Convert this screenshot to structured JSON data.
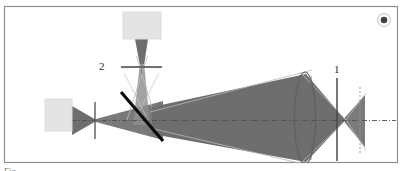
{
  "figure": {
    "type": "optical-ray-diagram",
    "title": "",
    "frame": {
      "stroke": "#8a8a8a",
      "x": 4,
      "y": 6,
      "width": 394,
      "height": 157
    },
    "background": "#ffffff",
    "colors": {
      "beam_fill": "#6e6e6e",
      "beam_fill_light": "#9a9a9a",
      "source_box": "#e2e2e2",
      "source_box_stroke": "#d2d2d2",
      "optic_line": "#4a4a4a",
      "beamsplitter": "#111111",
      "axis_dash": "#555555",
      "ray_outline": "#b5b5b5",
      "label_text": "#2b2b2b",
      "corner_mark": "#1a1a1a"
    },
    "labels": [
      {
        "id": "label-1",
        "text": "1",
        "x": 337,
        "y": 74,
        "describes": "aperture-stop-right"
      },
      {
        "id": "label-2",
        "text": "2",
        "x": 101,
        "y": 69,
        "describes": "lens-two"
      }
    ],
    "optical_axis": {
      "y": 120,
      "x_start": 72,
      "x_end": 396,
      "style": "dash-dot"
    },
    "elements": [
      {
        "id": "source-left",
        "name": "left-source-box",
        "shape": "rect",
        "x": 45,
        "y": 99,
        "width": 27,
        "height": 32,
        "fill": "#e2e2e2"
      },
      {
        "id": "source-top",
        "name": "top-source-box",
        "shape": "rect",
        "x": 123,
        "y": 12,
        "width": 38,
        "height": 27,
        "fill": "#e2e2e2"
      },
      {
        "id": "aperture-left",
        "name": "left-aperture-line",
        "shape": "vline",
        "x": 95,
        "y1": 102,
        "y2": 139
      },
      {
        "id": "lens-two",
        "name": "lens-two-thin-lens",
        "shape": "hline",
        "y": 67,
        "x1": 121,
        "x2": 162
      },
      {
        "id": "beamsplitter",
        "name": "beamsplitter-diagonal",
        "shape": "line",
        "x1": 121,
        "y1": 93,
        "x2": 163,
        "y2": 140,
        "stroke_width": 3
      },
      {
        "id": "lens-one",
        "name": "main-objective-lens",
        "shape": "ellipse",
        "cx": 305,
        "cy": 118,
        "rx": 10,
        "ry": 46
      },
      {
        "id": "aperture-right",
        "name": "right-aperture-line",
        "shape": "vline",
        "x": 337,
        "y1": 78,
        "y2": 160
      },
      {
        "id": "image-plane",
        "name": "image-plane-dashed",
        "shape": "vline-dashed",
        "x": 360,
        "y1": 87,
        "y2": 154
      },
      {
        "id": "corner-mark",
        "name": "page-corner-mark",
        "shape": "blob",
        "cx": 384,
        "cy": 20,
        "r": 3.2
      }
    ],
    "beams": [
      {
        "id": "beam-left-source",
        "name": "left-source-beam",
        "description": "beam from left box converging to waist at left aperture then diverging toward beamsplitter"
      },
      {
        "id": "beam-top-source",
        "name": "top-source-beam",
        "description": "beam from top box converging through lens 2 down to beamsplitter"
      },
      {
        "id": "beam-main",
        "name": "main-expanding-beam",
        "description": "broad beam expanding rightward from beamsplitter to objective lens"
      },
      {
        "id": "beam-focus",
        "name": "focused-beam-right",
        "description": "beam converging to focus at image plane then diverging"
      }
    ]
  },
  "caption": {
    "text": "Fig."
  }
}
